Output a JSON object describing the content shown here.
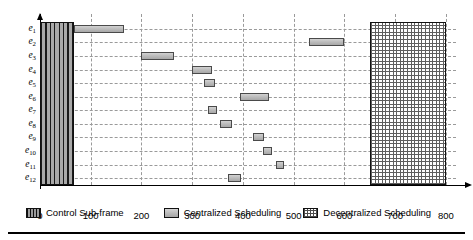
{
  "chart_data": {
    "type": "bar",
    "orientation": "horizontal-gantt",
    "title": "",
    "xlabel": "",
    "ylabel": "",
    "xlim": [
      0,
      820
    ],
    "ylim_categories": [
      "e1",
      "e2",
      "e3",
      "e4",
      "e5",
      "e6",
      "e7",
      "e8",
      "e9",
      "e10",
      "e11",
      "e12"
    ],
    "xticks": [
      0,
      100,
      200,
      300,
      400,
      500,
      600,
      700,
      800
    ],
    "xtick_labels": [
      "0",
      "100",
      "200",
      "300",
      "400",
      "500",
      "600",
      "700",
      "800"
    ],
    "grid": "dashed-both",
    "legend_position": "below-axes",
    "categories": [
      {
        "base": "e",
        "sub": "1"
      },
      {
        "base": "e",
        "sub": "2"
      },
      {
        "base": "e",
        "sub": "3"
      },
      {
        "base": "e",
        "sub": "4"
      },
      {
        "base": "e",
        "sub": "5"
      },
      {
        "base": "e",
        "sub": "6"
      },
      {
        "base": "e",
        "sub": "7"
      },
      {
        "base": "e",
        "sub": "8"
      },
      {
        "base": "e",
        "sub": "9"
      },
      {
        "base": "e",
        "sub": "10"
      },
      {
        "base": "e",
        "sub": "11"
      },
      {
        "base": "e",
        "sub": "12"
      }
    ],
    "series": [
      {
        "name": "Control Sub-frame",
        "pattern": "vertical-stripes-dark",
        "spans_all_rows": true,
        "start": 0,
        "end": 68
      },
      {
        "name": "Decentralized Scheduling",
        "pattern": "cross-hatch",
        "spans_all_rows": true,
        "start": 650,
        "end": 800
      },
      {
        "name": "Centralized Scheduling",
        "pattern": "solid-gray",
        "bars": [
          {
            "row": "e1",
            "start": 68,
            "end": 165
          },
          {
            "row": "e2",
            "start": 530,
            "end": 600
          },
          {
            "row": "e3",
            "start": 200,
            "end": 265
          },
          {
            "row": "e4",
            "start": 300,
            "end": 340
          },
          {
            "row": "e5",
            "start": 323,
            "end": 345
          },
          {
            "row": "e6",
            "start": 395,
            "end": 452
          },
          {
            "row": "e7",
            "start": 331,
            "end": 348
          },
          {
            "row": "e8",
            "start": 355,
            "end": 378
          },
          {
            "row": "e9",
            "start": 420,
            "end": 441
          },
          {
            "row": "e10",
            "start": 440,
            "end": 457
          },
          {
            "row": "e11",
            "start": 465,
            "end": 481
          },
          {
            "row": "e12",
            "start": 370,
            "end": 396
          }
        ]
      }
    ]
  },
  "legend": {
    "items": [
      {
        "label": "Control Sub-frame",
        "swatch": "control-subframe-swatch",
        "color": "#3a3a3a"
      },
      {
        "label": "Centralized Scheduling",
        "swatch": "centralized-scheduling-swatch",
        "color": "#bdbdbd"
      },
      {
        "label": "Decentralized Scheduling",
        "swatch": "decentralized-scheduling-swatch",
        "color": "#5f5f5f"
      }
    ]
  },
  "axes": {
    "y_arrow_icon": "arrow-up-icon",
    "x_arrow_icon": "arrow-right-icon"
  }
}
